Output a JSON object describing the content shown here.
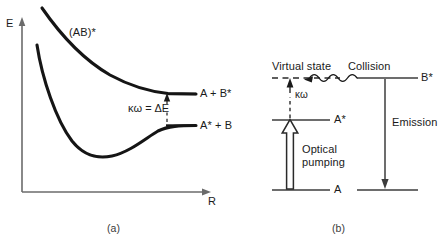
{
  "figure": {
    "title_hidden": "",
    "panels": [
      {
        "id": "a",
        "caption": "(a)",
        "type": "potential-energy-curves",
        "axes": {
          "y_label": "E",
          "x_label": "R"
        },
        "curve_labels": {
          "upper_curve": "(AB)*",
          "upper_asymptote": "A + B*",
          "lower_asymptote": "A* + B"
        },
        "transition_label": "κω = ΔE"
      },
      {
        "id": "b",
        "caption": "(b)",
        "type": "energy-level-diagram",
        "levels": {
          "virtual_state": "Virtual state",
          "excited_a": "A*",
          "ground_a": "A",
          "excited_b": "B*"
        },
        "processes": {
          "photon": "κω",
          "pumping": "Optical\npumping",
          "collision": "Collision",
          "emission": "Emission"
        }
      }
    ]
  },
  "colors": {
    "curve": "#151515",
    "axis": "#6b6b6b",
    "level_line": "#4a4a4a",
    "text": "#1a1a1a",
    "background": "#ffffff"
  }
}
